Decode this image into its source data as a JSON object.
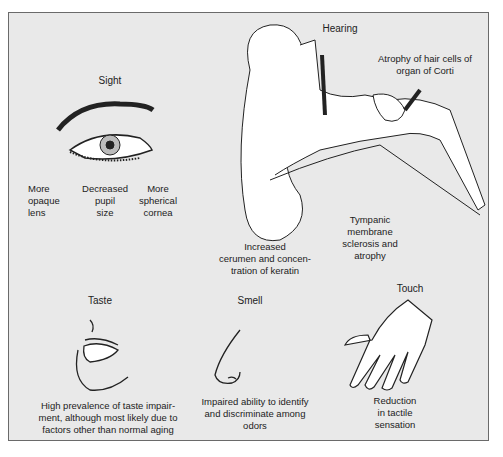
{
  "figure": {
    "background_color": "#e9e9e9",
    "border_color": "#6a6a6a",
    "senses": [
      {
        "name": "Sight",
        "changes": [
          "More\nopaque\nlens",
          "Decreased\npupil\nsize",
          "More\nspherical\ncornea"
        ]
      },
      {
        "name": "Hearing",
        "changes": [
          "Atrophy of hair cells of\norgan of Corti",
          "Increased\ncerumen and concen-\ntration of keratin",
          "Tympanic\nmembrane\nsclerosis and\natrophy"
        ]
      },
      {
        "name": "Taste",
        "changes": [
          "High prevalence of taste impair-\nment, although most likely due to\nfactors other than normal aging"
        ]
      },
      {
        "name": "Smell",
        "changes": [
          "Impaired ability to identify\nand discriminate among\nodors"
        ]
      },
      {
        "name": "Touch",
        "changes": [
          "Reduction\nin tactile\nsensation"
        ]
      }
    ]
  }
}
